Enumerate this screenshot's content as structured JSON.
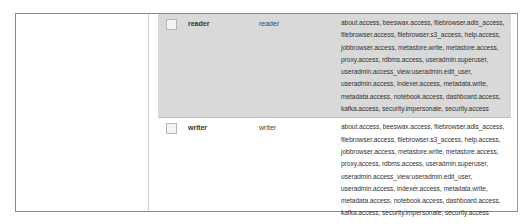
{
  "roles_table": {
    "rows": [
      {
        "name": "reader",
        "description": "reader",
        "selected": true,
        "privileges_lines": [
          "about.access, beeswax.access, filebrowser.adls_access,",
          "filebrowser.access, filebrowser.s3_access, help.access,",
          "jobbrowser.access, metastore.write, metastore.access,",
          "proxy.access, rdbms.access, useradmin.superuser,",
          "useradmin.access_view:useradmin.edit_user,",
          "useradmin.access, indexer.access, metadata.write,",
          "metadata.access, notebook.access, dashboard.access,",
          "kafka.access, security.impersonate, security.access"
        ]
      },
      {
        "name": "writer",
        "description": "writer",
        "selected": false,
        "privileges_lines": [
          "about.access, beeswax.access, filebrowser.adls_access,",
          "filebrowser.access, filebrowser.s3_access, help.access,",
          "jobbrowser.access, metastore.write, metastore.access,",
          "proxy.access, rdbms.access, useradmin.superuser,",
          "useradmin.access_view:useradmin.edit_user,",
          "useradmin.access, indexer.access, metadata.write,",
          "metadata.access, notebook.access, dashboard.access,",
          "kafka.access, security.impersonate, security.access"
        ]
      }
    ]
  },
  "colors": {
    "selected_row_bg": "#d9d9d9",
    "border": "#8a8a8a"
  }
}
